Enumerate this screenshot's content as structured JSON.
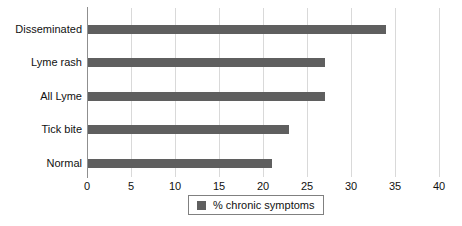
{
  "chart_data": {
    "type": "bar",
    "orientation": "horizontal",
    "categories": [
      "Disseminated",
      "Lyme rash",
      "All Lyme",
      "Tick bite",
      "Normal"
    ],
    "values": [
      34,
      27,
      27,
      23,
      21
    ],
    "series_name": "% chronic symptoms",
    "title": "",
    "xlabel": "",
    "ylabel": "",
    "xlim": [
      0,
      40
    ],
    "xticks": [
      0,
      5,
      10,
      15,
      20,
      25,
      30,
      35,
      40
    ],
    "grid": "vertical-only",
    "legend_position": "bottom-center",
    "colors": {
      "bar": "#5f5f5f",
      "gridline": "#d9d9d9",
      "axis_line": "#8f8f8f",
      "text": "#111111",
      "legend_border": "#808080",
      "background": "#ffffff"
    }
  }
}
